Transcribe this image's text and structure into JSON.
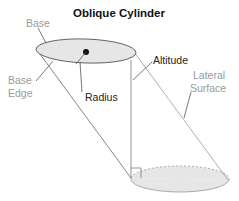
{
  "title": "Oblique Cylinder",
  "labels": {
    "base": "Base",
    "base_edge_line1": "Base",
    "base_edge_line2": "Edge",
    "radius": "Radius",
    "altitude": "Altitude",
    "lateral_line1": "Lateral",
    "lateral_line2": "Surface"
  },
  "colors": {
    "base_fill": "#e6e6e6",
    "outline": "#555555",
    "gray_label": "#9a9a9a",
    "dark_label": "#222222",
    "side_line": "#888888"
  }
}
